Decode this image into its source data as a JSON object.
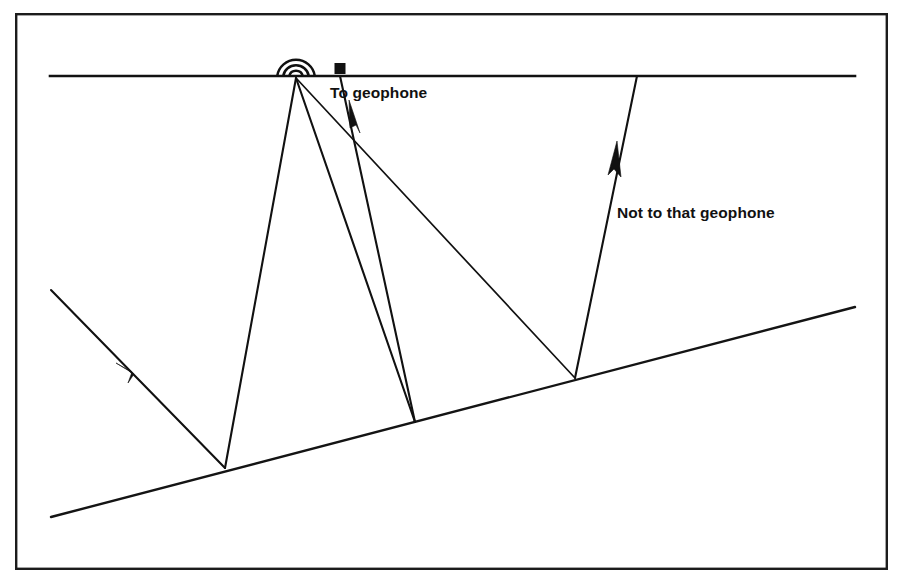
{
  "figure": {
    "background_color": "#ffffff",
    "line_color": "#111111",
    "frame": {
      "name": "figure-border",
      "x": 15,
      "y": 13,
      "width": 873,
      "height": 557
    }
  },
  "labels": {
    "to_geophone": "To geophone",
    "not_to_geophone": "Not to that geophone"
  },
  "surface": {
    "name": "ground-surface-line",
    "x1": 50,
    "y1": 76,
    "x2": 855,
    "y2": 76
  },
  "reflector": {
    "name": "dipping-reflector-interface",
    "x1": 51,
    "y1": 517,
    "x2": 855,
    "y2": 307
  },
  "source": {
    "name": "seismic-source",
    "x": 296,
    "y": 78,
    "arc_radii": [
      7,
      13,
      19
    ]
  },
  "geophone": {
    "name": "geophone-marker",
    "x": 340,
    "y": 68,
    "size": 10
  },
  "reflection_points": {
    "left": {
      "x": 225,
      "y": 468
    },
    "middle": {
      "x": 415,
      "y": 422
    },
    "right": {
      "x": 575,
      "y": 378
    }
  },
  "rays": [
    {
      "id": "downgoing-left",
      "from": {
        "x": 296,
        "y": 78
      },
      "to": {
        "x": 225,
        "y": 468
      },
      "arrow": false
    },
    {
      "id": "reflected-up-left",
      "from": {
        "x": 225,
        "y": 468
      },
      "to": {
        "x": 51,
        "y": 290
      },
      "arrow": true,
      "arrow_at": {
        "x": 125,
        "y": 372
      }
    },
    {
      "id": "downgoing-middle",
      "from": {
        "x": 296,
        "y": 78
      },
      "to": {
        "x": 415,
        "y": 422
      },
      "arrow": false
    },
    {
      "id": "reflected-up-to-geophone",
      "from": {
        "x": 415,
        "y": 422
      },
      "to": {
        "x": 340,
        "y": 76
      },
      "arrow": true,
      "arrow_at": {
        "x": 356,
        "y": 112
      }
    },
    {
      "id": "downgoing-right",
      "from": {
        "x": 296,
        "y": 78
      },
      "to": {
        "x": 575,
        "y": 378
      },
      "arrow": false
    },
    {
      "id": "reflected-up-right",
      "from": {
        "x": 575,
        "y": 378
      },
      "to": {
        "x": 637,
        "y": 76
      },
      "arrow": true,
      "arrow_at": {
        "x": 614,
        "y": 156
      }
    }
  ]
}
